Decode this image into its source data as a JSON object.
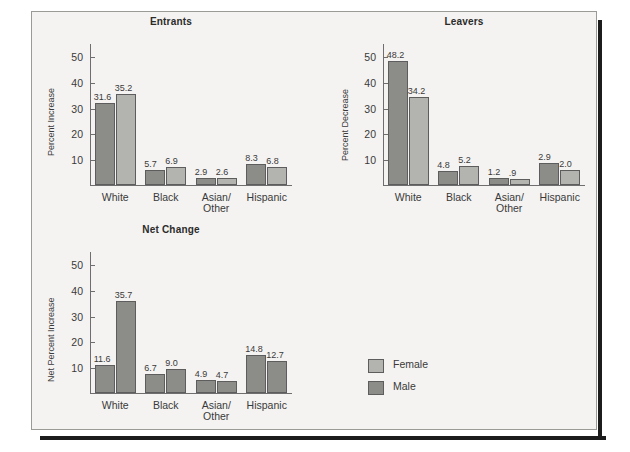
{
  "figure": {
    "legend": {
      "items": [
        {
          "label": "Female",
          "color": "#b3b3b0"
        },
        {
          "label": "Male",
          "color": "#8c8c89"
        }
      ]
    },
    "colors": {
      "female": "#b3b3b0",
      "male": "#8c8c89",
      "bar_outline": "#5d5d5d",
      "axis": "#6e6e6e",
      "text": "#3a3a3a",
      "title": "#2b2b2b",
      "background": "#f4f3f1",
      "frame_border": "#9a9a96",
      "shadow": "#1c1c1c"
    }
  },
  "chart_data": [
    {
      "type": "bar",
      "title": "Entrants",
      "xlabel": "",
      "ylabel": "Percent Increase",
      "ylim": [
        0,
        55
      ],
      "yticks": [
        10,
        20,
        30,
        40,
        50
      ],
      "grid": false,
      "legend_position": "outside-bottom-right",
      "categories": [
        "White",
        "Black",
        "Asian/\nOther",
        "Hispanic"
      ],
      "series": [
        {
          "name": "Male",
          "color": "#8c8c89",
          "values": [
            31.6,
            5.7,
            2.9,
            8.3
          ],
          "drawn": [
            31.6,
            5.7,
            2.9,
            8.3
          ]
        },
        {
          "name": "Female",
          "color": "#b3b3b0",
          "values": [
            35.2,
            6.9,
            2.6,
            6.8
          ],
          "drawn": [
            35.2,
            6.9,
            2.6,
            6.8
          ]
        }
      ],
      "value_labels": [
        [
          "31.6",
          "5.7",
          "2.9",
          "8.3"
        ],
        [
          "35.2",
          "6.9",
          "2.6",
          "6.8"
        ]
      ]
    },
    {
      "type": "bar",
      "title": "Leavers",
      "xlabel": "",
      "ylabel": "Percent Decrease",
      "ylim": [
        0,
        55
      ],
      "yticks": [
        10,
        20,
        30,
        40,
        50
      ],
      "grid": false,
      "legend_position": "outside-bottom-right",
      "categories": [
        "White",
        "Black",
        "Asian/\nOther",
        "Hispanic"
      ],
      "series": [
        {
          "name": "Male",
          "color": "#8c8c89",
          "values": [
            48.2,
            4.8,
            1.2,
            2.9
          ],
          "drawn": [
            48.2,
            5.5,
            2.6,
            8.4
          ]
        },
        {
          "name": "Female",
          "color": "#b3b3b0",
          "values": [
            34.2,
            5.2,
            0.9,
            2.0
          ],
          "drawn": [
            34.2,
            7.2,
            2.4,
            6.0
          ]
        }
      ],
      "value_labels": [
        [
          "48.2",
          "4.8",
          "1.2",
          "2.9"
        ],
        [
          "34.2",
          "5.2",
          ".9",
          "2.0"
        ]
      ]
    },
    {
      "type": "bar",
      "title": "Net Change",
      "xlabel": "",
      "ylabel": "Net Percent Increase",
      "ylim": [
        0,
        55
      ],
      "yticks": [
        10,
        20,
        30,
        40,
        50
      ],
      "grid": false,
      "legend_position": "outside-right",
      "categories": [
        "White",
        "Black",
        "Asian/\nOther",
        "Hispanic"
      ],
      "series": [
        {
          "name": "Male",
          "color": "#8c8c89",
          "values": [
            11.6,
            6.7,
            4.9,
            14.8
          ],
          "drawn": [
            10.9,
            7.5,
            5.0,
            14.8
          ]
        },
        {
          "name": "Female",
          "color": "#8c8c89",
          "values": [
            35.7,
            9.0,
            4.7,
            12.7
          ],
          "drawn": [
            35.7,
            9.3,
            4.7,
            12.3
          ]
        }
      ],
      "value_labels": [
        [
          "11.6",
          "6.7",
          "4.9",
          "14.8"
        ],
        [
          "35.7",
          "9.0",
          "4.7",
          "12.7"
        ]
      ]
    }
  ]
}
